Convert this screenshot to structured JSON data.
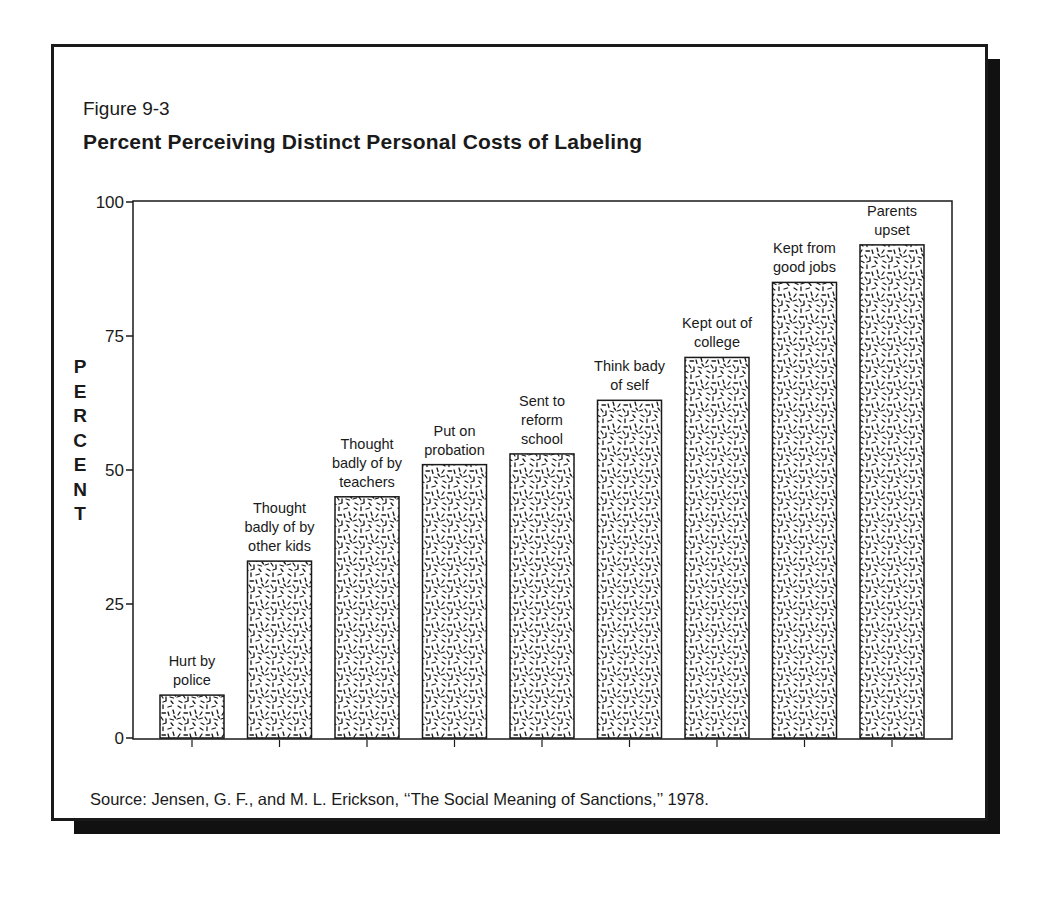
{
  "figure": {
    "number": "Figure 9-3",
    "title": "Percent Perceiving Distinct Personal Costs of Labeling",
    "source": "Source: Jensen, G. F., and M. L. Erickson, ‘‘The Social Meaning of Sanctions,’’ 1978."
  },
  "axis": {
    "ylabel_letters": [
      "P",
      "E",
      "R",
      "C",
      "E",
      "N",
      "T"
    ],
    "yticks": [
      "0",
      "25",
      "50",
      "75",
      "100"
    ]
  },
  "colors": {
    "ink": "#1a1a1a",
    "background": "#ffffff",
    "shadow": "#111111"
  },
  "chart_data": {
    "type": "bar",
    "title": "Percent Perceiving Distinct Personal Costs of Labeling",
    "xlabel": "",
    "ylabel": "PERCENT",
    "ylim": [
      0,
      100
    ],
    "yticks": [
      0,
      25,
      50,
      75,
      100
    ],
    "grid": false,
    "legend": null,
    "fill_pattern": "random dashes (stipple)",
    "categories": [
      "Hurt by police",
      "Thought badly of by other kids",
      "Thought badly of by teachers",
      "Put on probation",
      "Sent to reform school",
      "Think bady of self",
      "Kept out of college",
      "Kept from good jobs",
      "Parents upset"
    ],
    "category_label_lines": [
      [
        "Hurt by",
        "police"
      ],
      [
        "Thought",
        "badly of by",
        "other kids"
      ],
      [
        "Thought",
        "badly of by",
        "teachers"
      ],
      [
        "Put on",
        "probation"
      ],
      [
        "Sent to",
        "reform",
        "school"
      ],
      [
        "Think bady",
        "of self"
      ],
      [
        "Kept out of",
        "college"
      ],
      [
        "Kept from",
        "good jobs"
      ],
      [
        "Parents",
        "upset"
      ]
    ],
    "values": [
      8,
      33,
      45,
      51,
      53,
      63,
      71,
      85,
      92
    ],
    "source": "Jensen, G. F., and M. L. Erickson, \"The Social Meaning of Sanctions,\" 1978."
  }
}
